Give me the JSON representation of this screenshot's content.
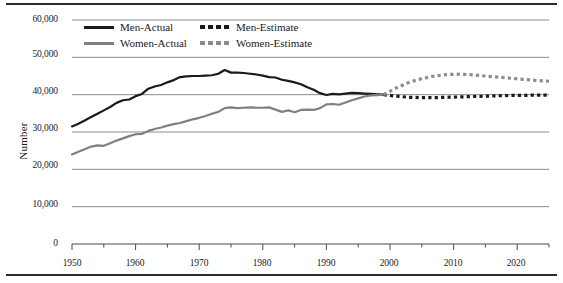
{
  "chart_data": {
    "type": "line",
    "title": "",
    "xlabel": "",
    "ylabel": "Number",
    "xlim": [
      1950,
      2025
    ],
    "ylim": [
      0,
      60000
    ],
    "ytick_labels": [
      "0",
      "10,000",
      "20,000",
      "30,000",
      "40,000",
      "50,000",
      "60,000"
    ],
    "ytick_values": [
      0,
      10000,
      20000,
      30000,
      40000,
      50000,
      60000
    ],
    "xtick_labels": [
      "1950",
      "1960",
      "1970",
      "1980",
      "1990",
      "2000",
      "2010",
      "2020"
    ],
    "xtick_values": [
      1950,
      1960,
      1970,
      1980,
      1990,
      2000,
      2010,
      2020
    ],
    "minor_xtick_step": 5,
    "grid": "horizontal",
    "legend_position": "top-left-inside",
    "series": [
      {
        "name": "Men-Actual",
        "style": "solid",
        "color": "#1a1a1a",
        "x": [
          1950,
          1951,
          1952,
          1953,
          1954,
          1955,
          1956,
          1957,
          1958,
          1959,
          1960,
          1961,
          1962,
          1963,
          1964,
          1965,
          1966,
          1967,
          1968,
          1969,
          1970,
          1971,
          1972,
          1973,
          1974,
          1975,
          1976,
          1977,
          1978,
          1979,
          1980,
          1981,
          1982,
          1983,
          1984,
          1985,
          1986,
          1987,
          1988,
          1989,
          1990,
          1991,
          1992,
          1993,
          1994,
          1995,
          1996,
          1997,
          1998,
          1999
        ],
        "values": [
          31500,
          32200,
          33100,
          34000,
          34900,
          35800,
          36700,
          37800,
          38500,
          38700,
          39600,
          40200,
          41600,
          42200,
          42600,
          43300,
          43900,
          44700,
          44900,
          45000,
          45000,
          45100,
          45200,
          45600,
          46600,
          45900,
          45900,
          45800,
          45600,
          45400,
          45100,
          44700,
          44600,
          44000,
          43700,
          43300,
          42800,
          42000,
          41300,
          40400,
          39900,
          40200,
          40100,
          40300,
          40500,
          40400,
          40300,
          40200,
          40100,
          40000
        ]
      },
      {
        "name": "Women-Actual",
        "style": "solid",
        "color": "#808080",
        "x": [
          1950,
          1951,
          1952,
          1953,
          1954,
          1955,
          1956,
          1957,
          1958,
          1959,
          1960,
          1961,
          1962,
          1963,
          1964,
          1965,
          1966,
          1967,
          1968,
          1969,
          1970,
          1971,
          1972,
          1973,
          1974,
          1975,
          1976,
          1977,
          1978,
          1979,
          1980,
          1981,
          1982,
          1983,
          1984,
          1985,
          1986,
          1987,
          1988,
          1989,
          1990,
          1991,
          1992,
          1993,
          1994,
          1995,
          1996,
          1997,
          1998,
          1999
        ],
        "values": [
          24000,
          24700,
          25400,
          26100,
          26400,
          26300,
          27000,
          27700,
          28300,
          28900,
          29400,
          29500,
          30300,
          30800,
          31200,
          31700,
          32100,
          32400,
          32900,
          33400,
          33800,
          34300,
          34900,
          35400,
          36400,
          36600,
          36400,
          36500,
          36600,
          36500,
          36500,
          36600,
          36000,
          35400,
          35800,
          35300,
          35900,
          36000,
          35900,
          36400,
          37400,
          37500,
          37300,
          37900,
          38500,
          39000,
          39500,
          39800,
          39900,
          40000
        ]
      },
      {
        "name": "Men-Estimate",
        "style": "dashed",
        "color": "#1a1a1a",
        "x": [
          1999,
          2001,
          2003,
          2005,
          2007,
          2009,
          2011,
          2013,
          2015,
          2017,
          2019,
          2021,
          2023,
          2025
        ],
        "values": [
          40000,
          39600,
          39300,
          39200,
          39200,
          39300,
          39400,
          39500,
          39600,
          39700,
          39800,
          39800,
          39900,
          39900
        ]
      },
      {
        "name": "Women-Estimate",
        "style": "dashed",
        "color": "#8c8c8c",
        "x": [
          1999,
          2001,
          2003,
          2005,
          2007,
          2009,
          2011,
          2013,
          2015,
          2017,
          2019,
          2021,
          2023,
          2025
        ],
        "values": [
          40000,
          41800,
          43300,
          44300,
          45000,
          45400,
          45500,
          45300,
          45000,
          44700,
          44400,
          44100,
          43800,
          43600
        ]
      }
    ]
  },
  "legend": {
    "entries": [
      {
        "label": "Men-Actual"
      },
      {
        "label": "Men-Estimate"
      },
      {
        "label": "Women-Actual"
      },
      {
        "label": "Women-Estimate"
      }
    ]
  },
  "axes": {
    "y_title": "Number",
    "y_ticks": [
      "60,000",
      "50,000",
      "40,000",
      "30,000",
      "20,000",
      "10,000",
      "0"
    ],
    "x_ticks": [
      "1950",
      "1960",
      "1970",
      "1980",
      "1990",
      "2000",
      "2010",
      "2020"
    ]
  },
  "colors": {
    "men": "#1a1a1a",
    "women": "#808080",
    "grid": "#8a8a8a",
    "rule": "#2b2b2b"
  }
}
